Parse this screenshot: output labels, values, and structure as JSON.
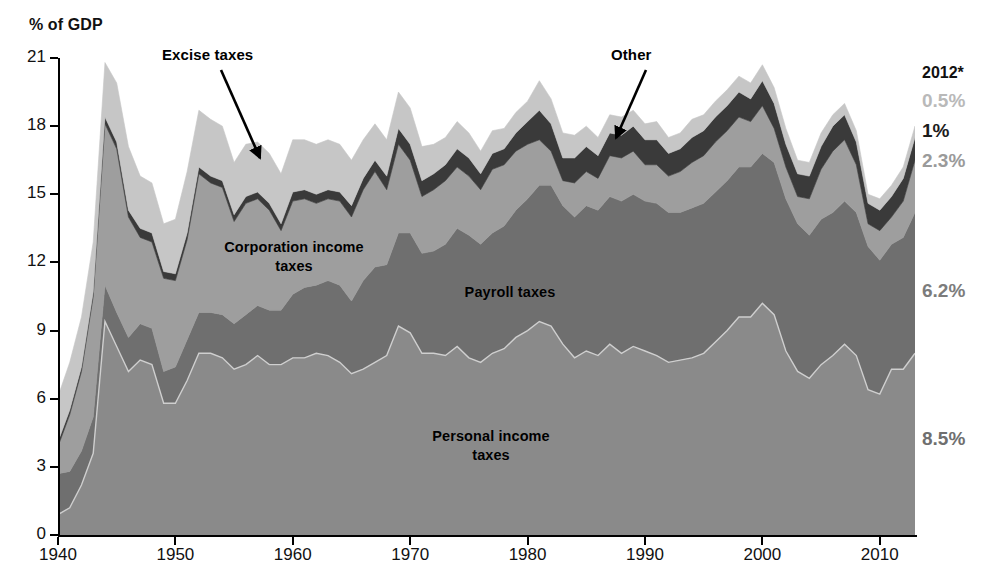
{
  "axis": {
    "y_title": "% of GDP",
    "y_ticks": [
      0,
      3,
      6,
      9,
      12,
      15,
      18,
      21
    ],
    "y_tick_labels": [
      "0",
      "3",
      "6",
      "9",
      "12",
      "15",
      "18",
      "21"
    ],
    "x_ticks": [
      1940,
      1950,
      1960,
      1970,
      1980,
      1990,
      2000,
      2010
    ],
    "x_tick_labels": [
      "1940",
      "1950",
      "1960",
      "1970",
      "1980",
      "1990",
      "2000",
      "2010"
    ],
    "ylim": [
      0,
      21
    ],
    "xlim": [
      1940,
      2013
    ]
  },
  "series_labels": {
    "corporation": "Corporation income\ntaxes",
    "corporation_line1": "Corporation income",
    "corporation_line2": "taxes",
    "payroll": "Payroll taxes",
    "personal_line1": "Personal income",
    "personal_line2": "taxes"
  },
  "callouts": {
    "excise": "Excise taxes",
    "other": "Other"
  },
  "right_values": {
    "year": "2012*",
    "excise": "0.5%",
    "other": "1%",
    "corporation": "2.3%",
    "payroll": "6.2%",
    "personal": "8.5%"
  },
  "colors": {
    "personal": "#8a8a8a",
    "payroll": "#6f6f6f",
    "corporation": "#9e9e9e",
    "other": "#3a3a3a",
    "excise": "#c6c6c6",
    "axis": "#000000",
    "background": "#ffffff"
  },
  "chart_data": {
    "type": "area",
    "title": "",
    "subtitle": "",
    "xlabel": "",
    "ylabel": "% of GDP",
    "ylim": [
      0,
      21
    ],
    "xlim": [
      1940,
      2013
    ],
    "grid": false,
    "legend": "in-chart labels",
    "stacked": true,
    "stack_order_bottom_to_top": [
      "Personal income taxes",
      "Payroll taxes",
      "Corporation income taxes",
      "Other",
      "Excise taxes"
    ],
    "annotations": [
      {
        "text": "Excise taxes",
        "points_to_year": 1957,
        "points_to_value": 16.2
      },
      {
        "text": "Other",
        "points_to_year": 1987,
        "points_to_value": 18.0
      },
      {
        "text": "2012*",
        "position": "right-margin"
      }
    ],
    "x": [
      1940,
      1941,
      1942,
      1943,
      1944,
      1945,
      1946,
      1947,
      1948,
      1949,
      1950,
      1951,
      1952,
      1953,
      1954,
      1955,
      1956,
      1957,
      1958,
      1959,
      1960,
      1961,
      1962,
      1963,
      1964,
      1965,
      1966,
      1967,
      1968,
      1969,
      1970,
      1971,
      1972,
      1973,
      1974,
      1975,
      1976,
      1977,
      1978,
      1979,
      1980,
      1981,
      1982,
      1983,
      1984,
      1985,
      1986,
      1987,
      1988,
      1989,
      1990,
      1991,
      1992,
      1993,
      1994,
      1995,
      1996,
      1997,
      1998,
      1999,
      2000,
      2001,
      2002,
      2003,
      2004,
      2005,
      2006,
      2007,
      2008,
      2009,
      2010,
      2011,
      2012,
      2013
    ],
    "series": [
      {
        "name": "Personal income taxes",
        "color": "#8a8a8a",
        "values": [
          0.9,
          1.2,
          2.2,
          3.6,
          9.4,
          8.3,
          7.2,
          7.7,
          7.5,
          5.8,
          5.8,
          6.8,
          8.0,
          8.0,
          7.8,
          7.3,
          7.5,
          7.9,
          7.5,
          7.5,
          7.8,
          7.8,
          8.0,
          7.9,
          7.6,
          7.1,
          7.3,
          7.6,
          7.9,
          9.2,
          8.9,
          8.0,
          8.0,
          7.9,
          8.3,
          7.8,
          7.6,
          8.0,
          8.2,
          8.7,
          9.0,
          9.4,
          9.2,
          8.4,
          7.8,
          8.1,
          7.9,
          8.4,
          8.0,
          8.3,
          8.1,
          7.9,
          7.6,
          7.7,
          7.8,
          8.0,
          8.5,
          9.0,
          9.6,
          9.6,
          10.2,
          9.7,
          8.1,
          7.2,
          6.9,
          7.5,
          7.9,
          8.4,
          7.9,
          6.4,
          6.2,
          7.3,
          7.3,
          8.0
        ]
      },
      {
        "name": "Payroll taxes",
        "color": "#6f6f6f",
        "values": [
          1.8,
          1.6,
          1.5,
          1.6,
          1.6,
          1.5,
          1.5,
          1.6,
          1.6,
          1.4,
          1.6,
          1.8,
          1.8,
          1.8,
          1.9,
          2.0,
          2.2,
          2.2,
          2.4,
          2.4,
          2.8,
          3.1,
          3.0,
          3.3,
          3.4,
          3.2,
          3.9,
          4.2,
          4.0,
          4.1,
          4.4,
          4.4,
          4.5,
          4.9,
          5.2,
          5.4,
          5.2,
          5.3,
          5.4,
          5.6,
          5.8,
          6.0,
          6.2,
          6.1,
          6.2,
          6.4,
          6.4,
          6.5,
          6.7,
          6.7,
          6.6,
          6.7,
          6.6,
          6.5,
          6.6,
          6.6,
          6.6,
          6.6,
          6.6,
          6.6,
          6.6,
          6.7,
          6.7,
          6.5,
          6.3,
          6.4,
          6.3,
          6.3,
          6.3,
          6.3,
          5.9,
          5.5,
          5.8,
          6.2
        ]
      },
      {
        "name": "Corporation income taxes",
        "color": "#9e9e9e",
        "values": [
          1.2,
          2.5,
          3.5,
          5.3,
          7.1,
          7.2,
          5.3,
          3.8,
          3.8,
          4.1,
          3.8,
          4.4,
          6.1,
          5.7,
          5.6,
          4.5,
          4.9,
          4.7,
          4.4,
          3.5,
          4.1,
          3.9,
          3.6,
          3.6,
          3.7,
          3.7,
          4.0,
          4.2,
          3.3,
          3.9,
          3.2,
          2.5,
          2.7,
          2.8,
          2.7,
          2.6,
          2.4,
          2.8,
          2.7,
          2.6,
          2.4,
          2.0,
          1.5,
          1.1,
          1.5,
          1.5,
          1.4,
          1.8,
          1.9,
          1.9,
          1.6,
          1.7,
          1.6,
          1.8,
          2.0,
          2.1,
          2.2,
          2.2,
          2.2,
          2.0,
          2.1,
          1.5,
          1.4,
          1.2,
          1.6,
          2.2,
          2.7,
          2.7,
          2.1,
          1.0,
          1.3,
          1.2,
          1.6,
          2.3
        ]
      },
      {
        "name": "Other",
        "color": "#3a3a3a",
        "values": [
          0.2,
          0.2,
          0.2,
          0.2,
          0.3,
          0.3,
          0.3,
          0.4,
          0.4,
          0.3,
          0.3,
          0.3,
          0.3,
          0.3,
          0.3,
          0.3,
          0.3,
          0.3,
          0.3,
          0.3,
          0.4,
          0.4,
          0.4,
          0.4,
          0.4,
          0.5,
          0.5,
          0.5,
          0.6,
          0.7,
          0.7,
          0.7,
          0.7,
          0.7,
          0.8,
          0.8,
          0.7,
          0.7,
          0.7,
          0.8,
          1.0,
          1.3,
          1.2,
          1.0,
          1.1,
          1.1,
          1.0,
          1.0,
          1.0,
          1.1,
          1.1,
          1.1,
          1.0,
          1.0,
          1.1,
          1.1,
          1.1,
          1.1,
          1.1,
          1.0,
          1.1,
          1.1,
          1.0,
          1.0,
          1.0,
          1.0,
          1.1,
          1.1,
          1.0,
          0.9,
          0.9,
          0.9,
          1.0,
          1.0
        ]
      },
      {
        "name": "Excise taxes",
        "color": "#c6c6c6",
        "values": [
          2.0,
          2.1,
          2.2,
          2.2,
          2.4,
          2.6,
          2.8,
          2.3,
          2.2,
          2.1,
          2.4,
          2.7,
          2.5,
          2.5,
          2.4,
          2.3,
          2.3,
          2.2,
          2.2,
          2.2,
          2.3,
          2.2,
          2.2,
          2.2,
          2.1,
          2.0,
          1.7,
          1.6,
          1.6,
          1.6,
          1.6,
          1.5,
          1.3,
          1.2,
          1.2,
          1.1,
          1.0,
          1.0,
          0.9,
          0.9,
          0.9,
          1.3,
          1.1,
          1.1,
          1.0,
          0.9,
          0.8,
          0.8,
          0.8,
          0.7,
          0.7,
          0.8,
          0.7,
          0.7,
          0.8,
          0.7,
          0.7,
          0.7,
          0.7,
          0.7,
          0.7,
          0.7,
          0.7,
          0.6,
          0.6,
          0.6,
          0.5,
          0.5,
          0.5,
          0.4,
          0.5,
          0.5,
          0.5,
          0.5
        ]
      }
    ]
  }
}
